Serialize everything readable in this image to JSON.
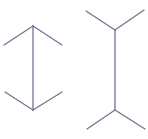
{
  "diagram": {
    "type": "muller-lyer-illusion",
    "stroke_color": "#6e7590",
    "stroke_width": 1.3,
    "figures": [
      {
        "name": "arrows-inward",
        "shaft": {
          "x1": 33,
          "y1": 26,
          "x2": 33,
          "y2": 110
        },
        "fins": [
          {
            "x1": 33,
            "y1": 26,
            "x2": 4,
            "y2": 45
          },
          {
            "x1": 33,
            "y1": 26,
            "x2": 62,
            "y2": 45
          },
          {
            "x1": 33,
            "y1": 110,
            "x2": 5,
            "y2": 92
          },
          {
            "x1": 33,
            "y1": 110,
            "x2": 62,
            "y2": 92
          }
        ]
      },
      {
        "name": "arrows-outward",
        "shaft": {
          "x1": 115,
          "y1": 30,
          "x2": 115,
          "y2": 110
        },
        "fins": [
          {
            "x1": 115,
            "y1": 30,
            "x2": 86,
            "y2": 11
          },
          {
            "x1": 115,
            "y1": 30,
            "x2": 144,
            "y2": 10
          },
          {
            "x1": 115,
            "y1": 110,
            "x2": 87,
            "y2": 129
          },
          {
            "x1": 115,
            "y1": 110,
            "x2": 145,
            "y2": 129
          }
        ]
      }
    ]
  }
}
